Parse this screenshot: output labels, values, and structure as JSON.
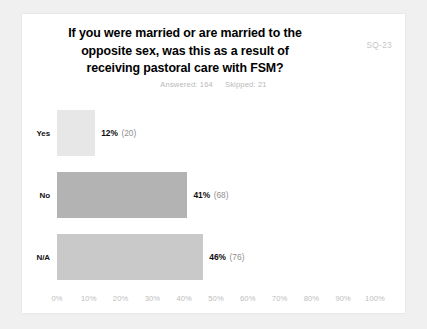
{
  "card": {
    "question_code": "SQ-23",
    "title_lines": [
      "If you were married or are married to the",
      "opposite sex, was this as a result of",
      "receiving pastoral care with FSM?"
    ],
    "answered_label": "Answered: 164",
    "skipped_label": "Skipped: 21"
  },
  "colors": {
    "page_background": "#f0f0f0",
    "card_background": "#ffffff",
    "title_text": "#000000",
    "code_text": "#c6c6c6",
    "counts_text": "#b9b9b9",
    "axis_text": "#bdbdbd",
    "value_text": "#0d0d0d",
    "count_text": "#8f8f8f",
    "bar_yes": "#e7e7e7",
    "bar_no": "#b3b3b3",
    "bar_na": "#c9c9c9"
  },
  "chart_data": {
    "type": "bar",
    "orientation": "horizontal",
    "title": "If you were married or are married to the opposite sex, was this as a result of receiving pastoral care with FSM?",
    "xlabel": "",
    "ylabel": "",
    "xlim": [
      0,
      100
    ],
    "grid": false,
    "legend": null,
    "categories": [
      "Yes",
      "No",
      "N/A"
    ],
    "values": [
      12,
      41,
      46
    ],
    "counts": [
      20,
      68,
      76
    ],
    "value_labels": [
      "12%",
      "41%",
      "46%"
    ],
    "count_labels": [
      "(20)",
      "(68)",
      "(76)"
    ],
    "bar_colors": [
      "#e7e7e7",
      "#b3b3b3",
      "#c9c9c9"
    ],
    "xticks": [
      0,
      10,
      20,
      30,
      40,
      50,
      60,
      70,
      80,
      90,
      100
    ],
    "xtick_labels": [
      "0%",
      "10%",
      "20%",
      "30%",
      "40%",
      "50%",
      "60%",
      "70%",
      "80%",
      "90%",
      "100%"
    ],
    "answered": 164,
    "skipped": 21
  }
}
